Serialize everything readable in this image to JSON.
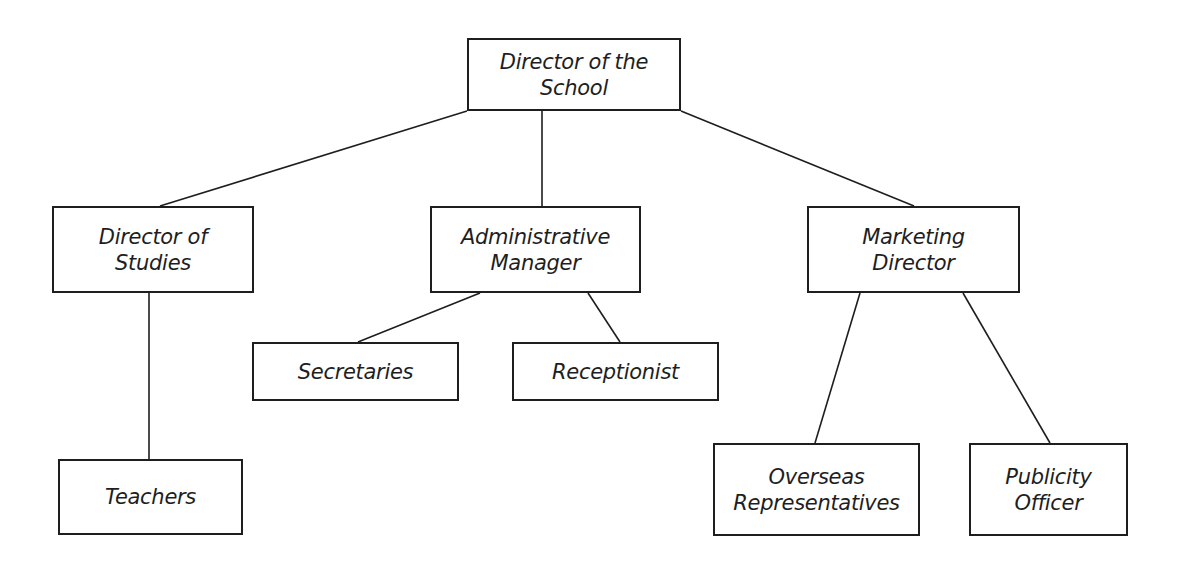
{
  "chart": {
    "nodes": [
      {
        "id": "director",
        "lines": [
          "Director of the",
          "School"
        ],
        "box": [
          467,
          38,
          214,
          73
        ]
      },
      {
        "id": "studies",
        "lines": [
          "Director of",
          "Studies"
        ],
        "box": [
          52,
          206,
          202,
          87
        ]
      },
      {
        "id": "admin",
        "lines": [
          "Administrative",
          "Manager"
        ],
        "box": [
          430,
          206,
          211,
          87
        ]
      },
      {
        "id": "marketing",
        "lines": [
          "Marketing",
          "Director"
        ],
        "box": [
          807,
          206,
          213,
          87
        ]
      },
      {
        "id": "secretaries",
        "lines": [
          "Secretaries"
        ],
        "box": [
          252,
          342,
          207,
          59
        ]
      },
      {
        "id": "receptionist",
        "lines": [
          "Receptionist"
        ],
        "box": [
          512,
          342,
          207,
          59
        ]
      },
      {
        "id": "teachers",
        "lines": [
          "Teachers"
        ],
        "box": [
          58,
          459,
          185,
          76
        ]
      },
      {
        "id": "overseas",
        "lines": [
          "Overseas",
          "Representatives"
        ],
        "box": [
          713,
          443,
          207,
          93
        ]
      },
      {
        "id": "publicity",
        "lines": [
          "Publicity",
          "Officer"
        ],
        "box": [
          969,
          443,
          159,
          93
        ]
      }
    ],
    "edges": [
      {
        "from": "director",
        "to": "studies",
        "line": [
          467,
          111,
          160,
          206
        ]
      },
      {
        "from": "director",
        "to": "admin",
        "line": [
          542,
          111,
          542,
          206
        ]
      },
      {
        "from": "director",
        "to": "marketing",
        "line": [
          681,
          111,
          914,
          206
        ]
      },
      {
        "from": "studies",
        "to": "teachers",
        "line": [
          149,
          293,
          149,
          459
        ]
      },
      {
        "from": "admin",
        "to": "secretaries",
        "line": [
          480,
          293,
          358,
          342
        ]
      },
      {
        "from": "admin",
        "to": "receptionist",
        "line": [
          588,
          293,
          620,
          342
        ]
      },
      {
        "from": "marketing",
        "to": "overseas",
        "line": [
          860,
          293,
          815,
          443
        ]
      },
      {
        "from": "marketing",
        "to": "publicity",
        "line": [
          963,
          293,
          1050,
          443
        ]
      }
    ],
    "colors": {
      "line": "#1e1e1e",
      "background": "#ffffff"
    }
  }
}
